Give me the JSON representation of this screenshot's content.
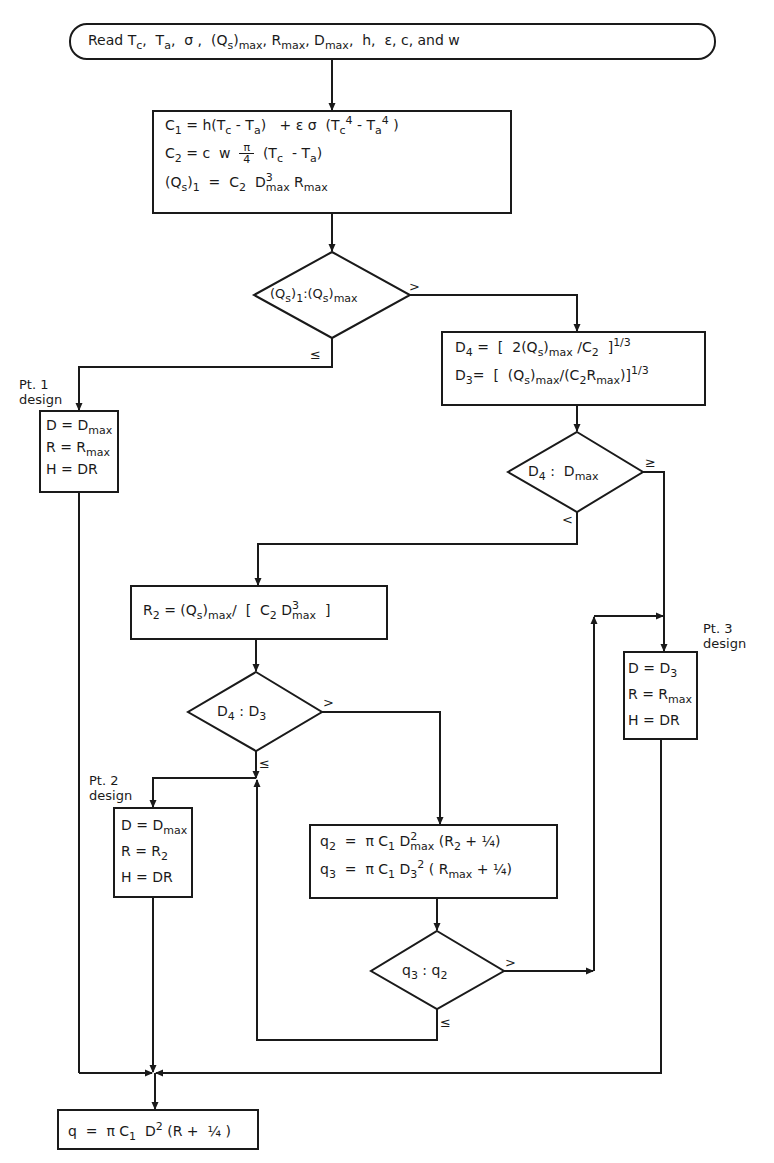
{
  "diagram": {
    "type": "flowchart",
    "colors": {
      "stroke": "#1a1a1a",
      "background": "#ffffff"
    },
    "start": {
      "text": "Read Tc, Ta, σ, (Qs)max, Rmax, Dmax, h, ε, c, and w"
    },
    "compute_constants": {
      "lines": [
        "C1 = h(Tc - Ta) + ε σ (Tc^4 - Ta^4)",
        "C2 = c w π/4 (Tc - Ta)",
        "(Qs)1 = C2 D^3max Rmax"
      ]
    },
    "decision_1": {
      "text": "(Qs)1 : (Qs)max",
      "branch_gt": ">",
      "branch_le": "≤"
    },
    "compute_d": {
      "lines": [
        "D4 = [ 2(Qs)max / C2 ]^1/3",
        "D3 = [ (Qs)max / (C2 Rmax) ]^1/3"
      ]
    },
    "pt1": {
      "label_line1": "Pt. 1",
      "label_line2": "design",
      "lines": [
        "D = Dmax",
        "R = Rmax",
        "H = DR"
      ]
    },
    "decision_2": {
      "text": "D4 : Dmax",
      "branch_ge": "≥",
      "branch_lt": "<"
    },
    "compute_r2": {
      "text": "R2 = (Qs)max / [ C2 D^3max ]"
    },
    "pt3": {
      "label_line1": "Pt. 3",
      "label_line2": "design",
      "lines": [
        "D = D3",
        "R = Rmax",
        "H = DR"
      ]
    },
    "decision_3": {
      "text": "D4 : D3",
      "branch_gt": ">",
      "branch_le": "≤"
    },
    "pt2": {
      "label_line1": "Pt. 2",
      "label_line2": "design",
      "lines": [
        "D = Dmax",
        "R = R2",
        "H = DR"
      ]
    },
    "compute_q": {
      "lines": [
        "q2 = π C1 D^2max (R2 + 1/4)",
        "q3 = π C1 D3^2 (Rmax + 1/4)"
      ]
    },
    "decision_4": {
      "text": "q3 : q2",
      "branch_gt": ">",
      "branch_le": "≤"
    },
    "end": {
      "text": "q = π C1 D^2 (R + 1/4)"
    },
    "glyphs": {
      "T": "T",
      "c": "c",
      "a": "a",
      "sigma": "σ",
      "Q": "Q",
      "s": "s",
      "max": "max",
      "R": "R",
      "D": "D",
      "h": "h",
      "eps": "ε",
      "w": "w",
      "pi": "π",
      "four": "4",
      "three": "3",
      "two": "2",
      "one": "1",
      "third": "1/3",
      "quarter": "¼",
      "H": "H",
      "q": "q"
    }
  }
}
